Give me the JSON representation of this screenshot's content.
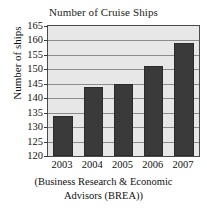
{
  "chart_data": {
    "type": "bar",
    "title": "Number of Cruise Ships",
    "xlabel": "",
    "ylabel": "Number of ships",
    "categories": [
      "2003",
      "2004",
      "2005",
      "2006",
      "2007"
    ],
    "values": [
      134,
      144,
      145,
      151,
      159
    ],
    "ylim": [
      120,
      165
    ],
    "ytick_labels": [
      "120",
      "125",
      "130",
      "135",
      "140",
      "145",
      "150",
      "155",
      "160",
      "165"
    ],
    "ytick_values": [
      120,
      125,
      130,
      135,
      140,
      145,
      150,
      155,
      160,
      165
    ],
    "ytick_step": 5,
    "grid": true,
    "legend": "none",
    "series": [
      {
        "name": "Number of ships",
        "values": [
          134,
          144,
          145,
          151,
          159
        ]
      }
    ],
    "annotations": {
      "caption_line1": "(Business Research & Economic",
      "caption_line2": "Advisors (BREA))"
    },
    "colors": {
      "bar": "#3a3a3a",
      "bar_edge": "#2b2b2b",
      "plot_background": "#e7e7e7",
      "gridline": "#8c8c8c",
      "axis": "#4a4a4a",
      "text": "#111111",
      "figure_background": "#ffffff"
    }
  }
}
